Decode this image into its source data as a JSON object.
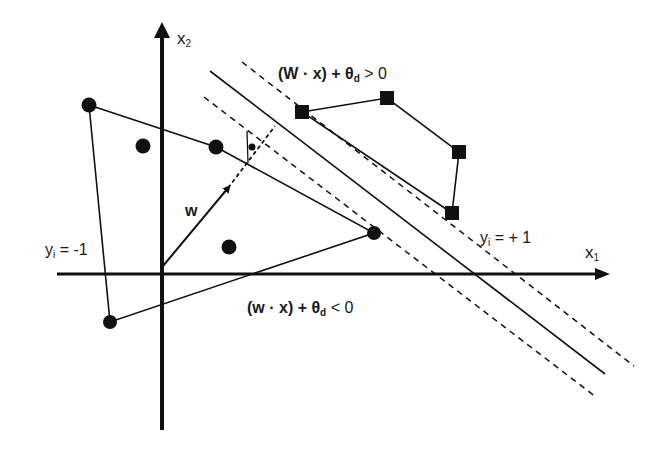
{
  "diagram": {
    "axes": {
      "x1": {
        "label": "x",
        "subscript": "1"
      },
      "x2": {
        "label": "x",
        "subscript": "2"
      }
    },
    "vector": {
      "label": "w"
    },
    "class_labels": {
      "negative": {
        "text": "y",
        "subscript": "i",
        "rest": " = -1"
      },
      "positive": {
        "text": "y",
        "subscript": "i",
        "rest": " = + 1"
      }
    },
    "inequalities": {
      "positive": {
        "main": "(W · x) + θ",
        "subscript": "d",
        "rest": " > 0"
      },
      "negative": {
        "main": "(w · x) + θ",
        "subscript": "d",
        "rest": " < 0"
      }
    },
    "points": {
      "negative_class_circles": [
        {
          "x": 89,
          "y": 105
        },
        {
          "x": 143,
          "y": 146
        },
        {
          "x": 216,
          "y": 147
        },
        {
          "x": 229,
          "y": 247
        },
        {
          "x": 374,
          "y": 233
        },
        {
          "x": 110,
          "y": 322
        }
      ],
      "positive_class_squares": [
        {
          "x": 302,
          "y": 112
        },
        {
          "x": 387,
          "y": 98
        },
        {
          "x": 459,
          "y": 152
        },
        {
          "x": 452,
          "y": 213
        }
      ]
    },
    "colors": {
      "ink": "#111111",
      "background": "#ffffff"
    }
  }
}
